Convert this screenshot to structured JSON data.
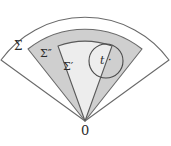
{
  "figure": {
    "type": "geometric-diagram",
    "labels": {
      "outer_sector": "Σ",
      "middle_sector": "Σ″",
      "inner_sector": "Σ′",
      "circle": "t ·",
      "origin": "0"
    },
    "colors": {
      "background": "#ffffff",
      "stroke": "#5a5a5a",
      "stroke_dark": "#3f3f3f",
      "outer_fill": "#ffffff",
      "middle_fill": "#cfcfcf",
      "inner_fill": "#ededed",
      "circle_fill": "none",
      "text": "#2b2b2b"
    },
    "geometry": {
      "apex": {
        "x": 85,
        "y": 121
      },
      "outer_sector": {
        "radius": 104,
        "angle_start_deg": 216,
        "angle_end_deg": 324
      },
      "middle_sector": {
        "radius": 92,
        "angle_start_deg": 232,
        "angle_end_deg": 312
      },
      "inner_sector": {
        "radius": 80,
        "angle_start_deg": 250,
        "angle_end_deg": 300
      },
      "circle": {
        "cx": 106,
        "cy": 61,
        "r": 17
      }
    }
  }
}
